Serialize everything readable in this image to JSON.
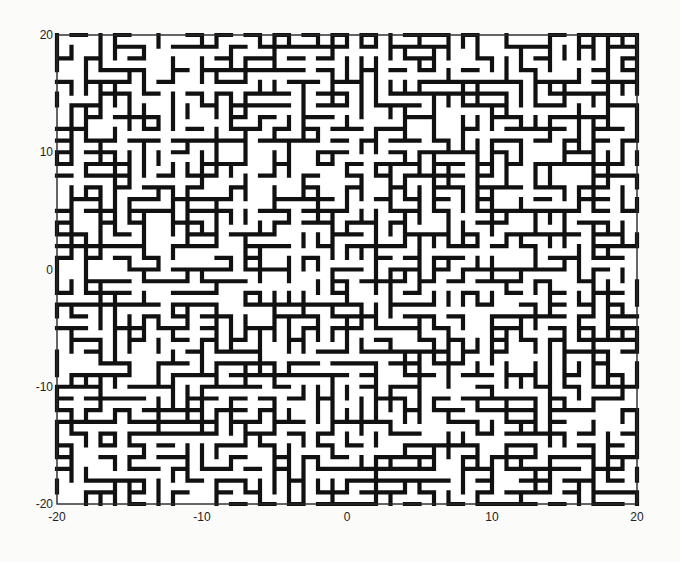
{
  "chart_data": {
    "type": "lattice-bond-plot",
    "title": "",
    "xlabel": "",
    "ylabel": "",
    "xlim": [
      -20,
      20
    ],
    "ylim": [
      -20,
      20
    ],
    "xticks": [
      -20,
      -10,
      0,
      10,
      20
    ],
    "yticks": [
      -20,
      -10,
      0,
      10,
      20
    ],
    "xtick_labels": [
      "-20",
      "-10",
      "0",
      "10",
      "20"
    ],
    "ytick_labels": [
      "-20",
      "-10",
      "0",
      "10",
      "20"
    ],
    "grid": false,
    "legend": null,
    "lattice_spacing": 1,
    "bond_occupation_estimate": 0.5,
    "line_color": "#111111",
    "background_color": "#ffffff"
  },
  "plot_area": {
    "left": 57,
    "top": 35,
    "right": 637,
    "bottom": 504
  }
}
